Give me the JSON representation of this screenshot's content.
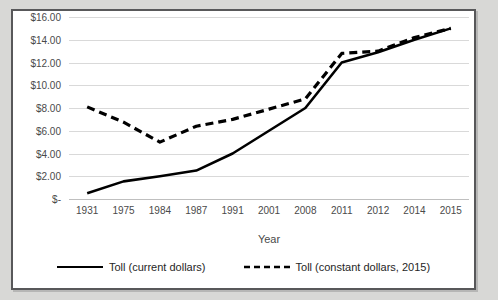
{
  "page": {
    "clipped_header_text": ""
  },
  "chart_data": {
    "type": "line",
    "title": "",
    "xlabel": "Year",
    "ylabel": "",
    "grid": true,
    "legend_position": "bottom",
    "categories": [
      "1931",
      "1975",
      "1984",
      "1987",
      "1991",
      "2001",
      "2008",
      "2011",
      "2012",
      "2014",
      "2015"
    ],
    "ylim": [
      0,
      16
    ],
    "ytick_values": [
      0,
      2,
      4,
      6,
      8,
      10,
      12,
      14,
      16
    ],
    "ytick_labels": [
      "$-",
      "$2.00",
      "$4.00",
      "$6.00",
      "$8.00",
      "$10.00",
      "$12.00",
      "$14.00",
      "$16.00"
    ],
    "series": [
      {
        "name": "Toll (current dollars)",
        "style": "solid",
        "color": "#000000",
        "values": [
          0.5,
          1.55,
          2.0,
          2.5,
          4.0,
          6.0,
          8.0,
          12.0,
          12.9,
          14.0,
          15.0
        ]
      },
      {
        "name": "Toll (constant dollars, 2015)",
        "style": "dashed",
        "color": "#000000",
        "values": [
          8.1,
          6.75,
          5.0,
          6.4,
          7.0,
          7.9,
          8.8,
          12.8,
          13.0,
          14.2,
          15.0
        ]
      }
    ]
  }
}
